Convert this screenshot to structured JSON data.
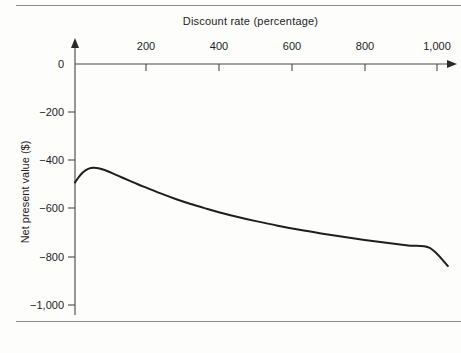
{
  "chart_data": {
    "type": "line",
    "title": "Discount rate (percentage)",
    "xlabel": "Discount rate (percentage)",
    "ylabel": "Net present value ($)",
    "xlim": [
      0,
      1060
    ],
    "ylim": [
      -1060,
      0
    ],
    "grid": false,
    "legend": null,
    "x_tick_labels": [
      "200",
      "400",
      "600",
      "800",
      "1,000"
    ],
    "x_tick_values": [
      200,
      400,
      600,
      800,
      1000
    ],
    "y_tick_labels": [
      "0",
      "−200",
      "−400",
      "−600",
      "−800",
      "−1,000"
    ],
    "y_tick_values": [
      0,
      -200,
      -400,
      -600,
      -800,
      -1000
    ],
    "series": [
      {
        "name": "Net present value",
        "color": "#1e1e1e",
        "x": [
          0,
          10,
          20,
          30,
          40,
          50,
          60,
          75,
          90,
          110,
          130,
          150,
          175,
          200,
          240,
          280,
          320,
          360,
          400,
          450,
          500,
          560,
          620,
          680,
          740,
          800,
          860,
          920,
          980,
          1030
        ],
        "y": [
          -492,
          -470,
          -452,
          -440,
          -433,
          -431,
          -432,
          -437,
          -445,
          -458,
          -471,
          -484,
          -500,
          -515,
          -539,
          -561,
          -581,
          -599,
          -616,
          -635,
          -652,
          -671,
          -688,
          -703,
          -717,
          -730,
          -742,
          -753,
          -763,
          -838
        ]
      }
    ]
  },
  "axes": {
    "x_axis_name": "top-horizontal-axis",
    "y_axis_name": "left-vertical-axis",
    "x_arrow": "arrow-right",
    "y_arrow": "arrow-up"
  }
}
